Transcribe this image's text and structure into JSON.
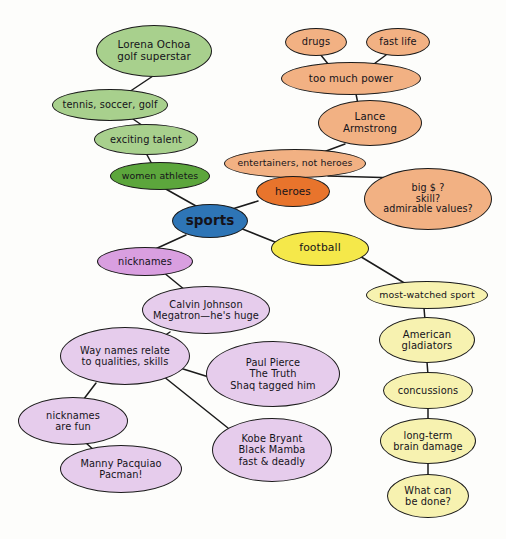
{
  "diagram": {
    "title": "sports",
    "type": "mind-map",
    "background_color": "#fdfdfb",
    "edge_color": "#1b1b1b",
    "palette": {
      "root_blue": "#2E75B6",
      "green_dark": "#5CA63C",
      "green_light": "#A8D08D",
      "orange_vivid": "#E8742C",
      "peach": "#F2B183",
      "yellow_bright": "#F5E84A",
      "yellow_pale": "#F7F2B0",
      "purple_dark": "#D99FE0",
      "purple_light": "#E6CCEC"
    }
  },
  "nodes": [
    {
      "id": "sports",
      "label": "sports",
      "x": 172,
      "y": 204,
      "w": 76,
      "h": 34,
      "fill": "#2E75B6",
      "fontSize": 13.5,
      "bold": true
    },
    {
      "id": "lorena",
      "label": "Lorena Ochoa\ngolf superstar",
      "x": 96,
      "y": 25,
      "w": 116,
      "h": 52,
      "fill": "#A8D08D",
      "fontSize": 10.4
    },
    {
      "id": "tennis",
      "label": "tennis, soccer, golf",
      "x": 52,
      "y": 89,
      "w": 116,
      "h": 32,
      "fill": "#A8D08D",
      "fontSize": 9.8
    },
    {
      "id": "exciting",
      "label": "exciting talent",
      "x": 94,
      "y": 124,
      "w": 104,
      "h": 31,
      "fill": "#A8D08D",
      "fontSize": 9.8
    },
    {
      "id": "women",
      "label": "women athletes",
      "x": 110,
      "y": 162,
      "w": 100,
      "h": 28,
      "fill": "#5CA63C",
      "fontSize": 9.4
    },
    {
      "id": "drugs",
      "label": "drugs",
      "x": 285,
      "y": 28,
      "w": 62,
      "h": 28,
      "fill": "#F2B183",
      "fontSize": 9.8
    },
    {
      "id": "fastlife",
      "label": "fast life",
      "x": 366,
      "y": 28,
      "w": 64,
      "h": 28,
      "fill": "#F2B183",
      "fontSize": 9.8
    },
    {
      "id": "toomuchpower",
      "label": "too much power",
      "x": 281,
      "y": 62,
      "w": 140,
      "h": 33,
      "fill": "#F2B183",
      "fontSize": 10.2
    },
    {
      "id": "lance",
      "label": "Lance\nArmstrong",
      "x": 318,
      "y": 100,
      "w": 104,
      "h": 46,
      "fill": "#F2B183",
      "fontSize": 10.2
    },
    {
      "id": "entertainers",
      "label": "entertainers, not heroes",
      "x": 224,
      "y": 149,
      "w": 142,
      "h": 29,
      "fill": "#F2B183",
      "fontSize": 9.3
    },
    {
      "id": "heroes",
      "label": "heroes",
      "x": 256,
      "y": 176,
      "w": 74,
      "h": 31,
      "fill": "#E8742C",
      "fontSize": 10.4
    },
    {
      "id": "bigmoney",
      "label": "big $ ?\nskill?\nadmirable values?",
      "x": 364,
      "y": 168,
      "w": 128,
      "h": 62,
      "fill": "#F2B183",
      "fontSize": 9.6
    },
    {
      "id": "football",
      "label": "football",
      "x": 271,
      "y": 231,
      "w": 98,
      "h": 35,
      "fill": "#F5E84A",
      "fontSize": 10.8
    },
    {
      "id": "mostwatched",
      "label": "most-watched sport",
      "x": 366,
      "y": 281,
      "w": 122,
      "h": 28,
      "fill": "#F7F2B0",
      "fontSize": 9.4
    },
    {
      "id": "gladiators",
      "label": "American\ngladiators",
      "x": 379,
      "y": 317,
      "w": 96,
      "h": 46,
      "fill": "#F7F2B0",
      "fontSize": 10.0
    },
    {
      "id": "concussions",
      "label": "concussions",
      "x": 383,
      "y": 372,
      "w": 90,
      "h": 37,
      "fill": "#F7F2B0",
      "fontSize": 9.8
    },
    {
      "id": "braindamage",
      "label": "long-term\nbrain damage",
      "x": 380,
      "y": 418,
      "w": 96,
      "h": 46,
      "fill": "#F7F2B0",
      "fontSize": 9.8
    },
    {
      "id": "whatcanbedone",
      "label": "What can\nbe done?",
      "x": 387,
      "y": 474,
      "w": 82,
      "h": 44,
      "fill": "#F7F2B0",
      "fontSize": 9.8
    },
    {
      "id": "nicknames",
      "label": "nicknames",
      "x": 97,
      "y": 247,
      "w": 96,
      "h": 29,
      "fill": "#D99FE0",
      "fontSize": 9.8
    },
    {
      "id": "calvin",
      "label": "Calvin Johnson\nMegatron—he's huge",
      "x": 142,
      "y": 286,
      "w": 128,
      "h": 48,
      "fill": "#E6CCEC",
      "fontSize": 9.8
    },
    {
      "id": "waynames",
      "label": "Way names relate\nto qualities, skills",
      "x": 60,
      "y": 327,
      "w": 130,
      "h": 58,
      "fill": "#E6CCEC",
      "fontSize": 9.8
    },
    {
      "id": "paulpierce",
      "label": "Paul Pierce\nThe Truth\nShaq tagged him",
      "x": 206,
      "y": 341,
      "w": 134,
      "h": 66,
      "fill": "#E6CCEC",
      "fontSize": 9.8
    },
    {
      "id": "nicknamesfun",
      "label": "nicknames\nare fun",
      "x": 18,
      "y": 397,
      "w": 110,
      "h": 48,
      "fill": "#E6CCEC",
      "fontSize": 9.8
    },
    {
      "id": "kobe",
      "label": "Kobe Bryant\nBlack Mamba\nfast & deadly",
      "x": 212,
      "y": 418,
      "w": 120,
      "h": 64,
      "fill": "#E6CCEC",
      "fontSize": 9.8
    },
    {
      "id": "manny",
      "label": "Manny Pacquiao\nPacman!",
      "x": 60,
      "y": 445,
      "w": 122,
      "h": 48,
      "fill": "#E6CCEC",
      "fontSize": 9.8
    }
  ],
  "edges": [
    {
      "from": "lorena",
      "to": "tennis",
      "x1": 156,
      "y1": 74,
      "x2": 120,
      "y2": 98
    },
    {
      "from": "tennis",
      "to": "exciting",
      "x1": 133,
      "y1": 119,
      "x2": 146,
      "y2": 128
    },
    {
      "from": "exciting",
      "to": "women",
      "x1": 146,
      "y1": 153,
      "x2": 153,
      "y2": 166
    },
    {
      "from": "women",
      "to": "sports",
      "x1": 164,
      "y1": 188,
      "x2": 196,
      "y2": 206
    },
    {
      "from": "drugs",
      "to": "toomuchpower",
      "x1": 320,
      "y1": 54,
      "x2": 333,
      "y2": 70
    },
    {
      "from": "fastlife",
      "to": "toomuchpower",
      "x1": 386,
      "y1": 55,
      "x2": 363,
      "y2": 72
    },
    {
      "from": "toomuchpower",
      "to": "lance",
      "x1": 356,
      "y1": 94,
      "x2": 358,
      "y2": 104
    },
    {
      "from": "lance",
      "to": "entertainers",
      "x1": 345,
      "y1": 144,
      "x2": 310,
      "y2": 157
    },
    {
      "from": "entertainers",
      "to": "heroes",
      "x1": 289,
      "y1": 176,
      "x2": 294,
      "y2": 184
    },
    {
      "from": "entertainers",
      "to": "bigmoney",
      "x1": 328,
      "y1": 176,
      "x2": 400,
      "y2": 178
    },
    {
      "from": "heroes",
      "to": "sports",
      "x1": 258,
      "y1": 201,
      "x2": 213,
      "y2": 215
    },
    {
      "from": "sports",
      "to": "football",
      "x1": 240,
      "y1": 228,
      "x2": 280,
      "y2": 244
    },
    {
      "from": "sports",
      "to": "nicknames",
      "x1": 186,
      "y1": 235,
      "x2": 153,
      "y2": 250
    },
    {
      "from": "football",
      "to": "mostwatched",
      "x1": 358,
      "y1": 255,
      "x2": 406,
      "y2": 284
    },
    {
      "from": "mostwatched",
      "to": "gladiators",
      "x1": 424,
      "y1": 308,
      "x2": 425,
      "y2": 320
    },
    {
      "from": "gladiators",
      "to": "concussions",
      "x1": 427,
      "y1": 362,
      "x2": 428,
      "y2": 375
    },
    {
      "from": "concussions",
      "to": "braindamage",
      "x1": 428,
      "y1": 407,
      "x2": 428,
      "y2": 421
    },
    {
      "from": "braindamage",
      "to": "whatcanbedone",
      "x1": 428,
      "y1": 462,
      "x2": 428,
      "y2": 477
    },
    {
      "from": "nicknames",
      "to": "calvin",
      "x1": 163,
      "y1": 272,
      "x2": 185,
      "y2": 290
    },
    {
      "from": "calvin",
      "to": "waynames",
      "x1": 170,
      "y1": 332,
      "x2": 152,
      "y2": 344
    },
    {
      "from": "waynames",
      "to": "paulpierce",
      "x1": 180,
      "y1": 368,
      "x2": 212,
      "y2": 378
    },
    {
      "from": "waynames",
      "to": "kobe",
      "x1": 158,
      "y1": 372,
      "x2": 228,
      "y2": 428
    },
    {
      "from": "waynames",
      "to": "nicknamesfun",
      "x1": 96,
      "y1": 383,
      "x2": 80,
      "y2": 404
    },
    {
      "from": "nicknamesfun",
      "to": "manny",
      "x1": 86,
      "y1": 443,
      "x2": 96,
      "y2": 452
    }
  ]
}
